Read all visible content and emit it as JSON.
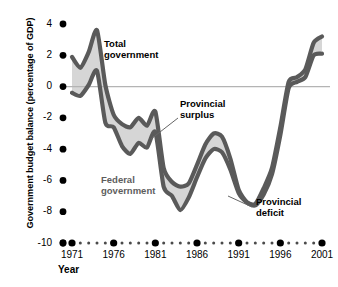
{
  "chart_data": {
    "type": "area",
    "title": "",
    "xlabel": "Year",
    "ylabel": "Government budget balance (percentage of GDP)",
    "xlim": [
      1971,
      2001
    ],
    "ylim": [
      -10,
      4
    ],
    "grid": false,
    "zero_line": true,
    "legend_position": "inline-annotations",
    "y_ticks": [
      4,
      2,
      0,
      -2,
      -4,
      -6,
      -8,
      -10
    ],
    "y_tick_labels": [
      "4",
      "2",
      "0",
      "-2",
      "-4",
      "-6",
      "-8",
      "-10"
    ],
    "x_ticks": [
      1971,
      1976,
      1981,
      1986,
      1991,
      1996,
      2001
    ],
    "x_tick_labels": [
      "1971",
      "1976",
      "1981",
      "1986",
      "1991",
      "1996",
      "2001"
    ],
    "x_minor_ticks_between_majors": 4,
    "series": [
      {
        "name": "Total government",
        "x": [
          1971,
          1972,
          1973,
          1974,
          1975,
          1976,
          1977,
          1978,
          1979,
          1980,
          1981,
          1982,
          1983,
          1984,
          1985,
          1986,
          1987,
          1988,
          1989,
          1990,
          1991,
          1992,
          1993,
          1994,
          1995,
          1996,
          1997,
          1998,
          1999,
          2000,
          2001
        ],
        "values": [
          1.9,
          1.2,
          2.2,
          3.6,
          0.1,
          -1.8,
          -2.4,
          -2.6,
          -2.0,
          -2.5,
          -1.6,
          -5.2,
          -6.1,
          -6.4,
          -6.2,
          -5.0,
          -3.7,
          -3.0,
          -3.2,
          -4.6,
          -6.6,
          -7.4,
          -7.5,
          -6.5,
          -5.2,
          -2.6,
          0.3,
          0.6,
          1.1,
          2.8,
          3.2
        ]
      },
      {
        "name": "Federal government",
        "x": [
          1971,
          1972,
          1973,
          1974,
          1975,
          1976,
          1977,
          1978,
          1979,
          1980,
          1981,
          1982,
          1983,
          1984,
          1985,
          1986,
          1987,
          1988,
          1989,
          1990,
          1991,
          1992,
          1993,
          1994,
          1995,
          1996,
          1997,
          1998,
          1999,
          2000,
          2001
        ],
        "values": [
          -0.4,
          -0.6,
          0.1,
          1.0,
          -2.3,
          -2.6,
          -3.8,
          -4.3,
          -3.6,
          -3.9,
          -2.9,
          -6.4,
          -7.0,
          -7.9,
          -7.1,
          -5.8,
          -4.6,
          -4.0,
          -4.2,
          -5.3,
          -6.8,
          -7.4,
          -7.6,
          -6.9,
          -5.6,
          -3.1,
          -0.1,
          0.3,
          0.6,
          2.0,
          2.1
        ]
      }
    ],
    "annotations": [
      {
        "key": "total_government",
        "text_line1": "Total",
        "text_line2": "government",
        "leader": false
      },
      {
        "key": "provincial_surplus",
        "text_line1": "Provincial",
        "text_line2": "surplus",
        "leader": true
      },
      {
        "key": "federal_government",
        "text_line1": "Federal",
        "text_line2": "government",
        "leader": false
      },
      {
        "key": "provincial_deficit",
        "text_line1": "Provincial",
        "text_line2": "deficit",
        "leader": true
      }
    ],
    "colors": {
      "line": "#5a5a5a",
      "band_fill": "#d6d6d6",
      "zero_line": "#b4b4b4",
      "tick_dot": "#000000",
      "text": "#000000",
      "muted_text": "#5d5d5d",
      "background": "#ffffff"
    }
  },
  "axis": {
    "y_title": "Government budget balance (percentage of GDP)",
    "x_title": "Year",
    "y_labels": [
      "4",
      "2",
      "0",
      "-2",
      "-4",
      "-6",
      "-8",
      "-10"
    ],
    "x_labels": [
      "1971",
      "1976",
      "1981",
      "1986",
      "1991",
      "1996",
      "2001"
    ]
  },
  "annotations": {
    "total_government": {
      "line1": "Total",
      "line2": "government"
    },
    "provincial_surplus": {
      "line1": "Provincial",
      "line2": "surplus"
    },
    "federal_government": {
      "line1": "Federal",
      "line2": "government"
    },
    "provincial_deficit": {
      "line1": "Provincial",
      "line2": "deficit"
    }
  }
}
